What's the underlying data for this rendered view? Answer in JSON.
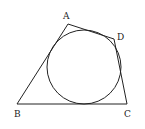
{
  "diagram": {
    "type": "geometry",
    "stroke_color": "#222222",
    "background": "#ffffff",
    "vertices": [
      {
        "name": "A",
        "x": 68,
        "y": 24,
        "label_x": 63,
        "label_y": 19
      },
      {
        "name": "B",
        "x": 17,
        "y": 104,
        "label_x": 14,
        "label_y": 117
      },
      {
        "name": "C",
        "x": 127,
        "y": 104,
        "label_x": 124,
        "label_y": 117
      },
      {
        "name": "D",
        "x": 114,
        "y": 39,
        "label_x": 117,
        "label_y": 40
      }
    ],
    "circle": {
      "cx": 84,
      "cy": 67,
      "r": 37
    },
    "labels": {
      "A": "A",
      "B": "B",
      "C": "C",
      "D": "D"
    }
  }
}
